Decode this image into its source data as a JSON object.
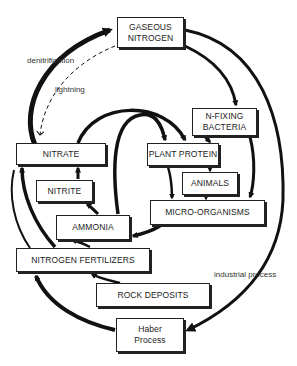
{
  "diagram": {
    "type": "cycle",
    "nodes": {
      "gaseous_nitrogen": [
        "GASEOUS",
        "NITROGEN"
      ],
      "n_fixing_bacteria": [
        "N-FIXING",
        "BACTERIA"
      ],
      "nitrate": "NITRATE",
      "plant_protein": "PLANT PROTEIN",
      "nitrite": "NITRITE",
      "animals": "ANIMALS",
      "micro_organisms": "MICRO-ORGANISMS",
      "ammonia": "AMMONIA",
      "nitrogen_fertilizers": "NITROGEN FERTILIZERS",
      "rock_deposits": "ROCK DEPOSITS",
      "haber_process": [
        "Haber",
        "Process"
      ]
    },
    "edge_labels": {
      "denitrification": "denitrification",
      "lightning": "lightning",
      "industrial_process": "industrial process"
    },
    "edges": [
      {
        "from": "NITRATE",
        "to": "GASEOUS NITROGEN",
        "label": "denitrification"
      },
      {
        "from": "GASEOUS NITROGEN",
        "to": "NITRATE",
        "label": "lightning",
        "style": "dashed"
      },
      {
        "from": "GASEOUS NITROGEN",
        "to": "N-FIXING BACTERIA"
      },
      {
        "from": "GASEOUS NITROGEN",
        "to": "Haber Process",
        "label": "industrial process"
      },
      {
        "from": "N-FIXING BACTERIA",
        "to": "PLANT PROTEIN"
      },
      {
        "from": "N-FIXING BACTERIA",
        "to": "MICRO-ORGANISMS"
      },
      {
        "from": "NITRATE",
        "to": "PLANT PROTEIN"
      },
      {
        "from": "AMMONIA",
        "to": "PLANT PROTEIN"
      },
      {
        "from": "PLANT PROTEIN",
        "to": "ANIMALS"
      },
      {
        "from": "PLANT PROTEIN",
        "to": "MICRO-ORGANISMS"
      },
      {
        "from": "ANIMALS",
        "to": "MICRO-ORGANISMS"
      },
      {
        "from": "MICRO-ORGANISMS",
        "to": "AMMONIA"
      },
      {
        "from": "AMMONIA",
        "to": "NITRITE"
      },
      {
        "from": "NITRITE",
        "to": "NITRATE"
      },
      {
        "from": "NITROGEN FERTILIZERS",
        "to": "NITRATE"
      },
      {
        "from": "NITROGEN FERTILIZERS",
        "to": "AMMONIA"
      },
      {
        "from": "ROCK DEPOSITS",
        "to": "NITROGEN FERTILIZERS"
      },
      {
        "from": "Haber Process",
        "to": "NITROGEN FERTILIZERS"
      }
    ]
  }
}
